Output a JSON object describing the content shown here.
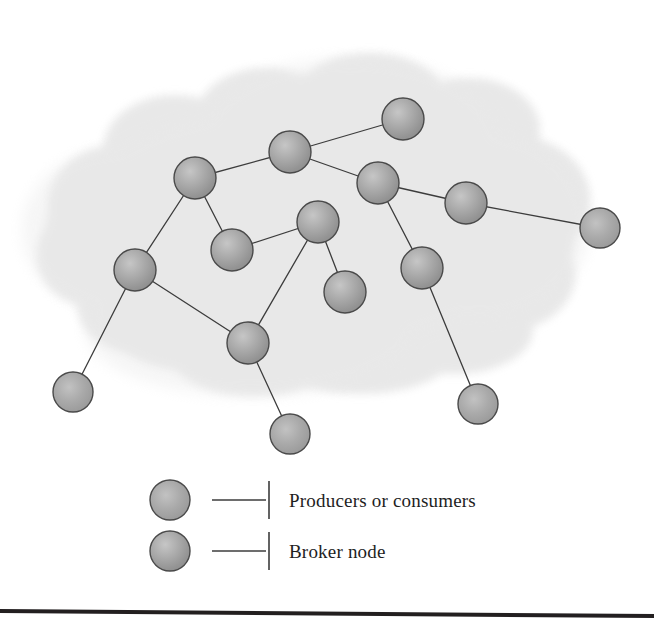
{
  "figure": {
    "background_color": "#ffffff",
    "cloud": {
      "name": "network-cloud",
      "fill_color": "#e6e6e6",
      "edge_color": "#dcdcdc"
    },
    "node_style": {
      "fill_light": "#bdbdbd",
      "fill_mid": "#9c9c9c",
      "fill_dark": "#878787",
      "stroke_color": "#4a4a4a",
      "radius": 21
    },
    "edge_style": {
      "stroke_color": "#3c3c3c",
      "stroke_width": 1.3
    },
    "rule": {
      "name": "bottom-rule",
      "color": "#231f20",
      "thickness": 4
    }
  },
  "graph": {
    "nodes": [
      {
        "id": "b1",
        "label": "broker-node-1",
        "kind": "broker",
        "x": 195,
        "y": 178,
        "r": 21
      },
      {
        "id": "b2",
        "label": "broker-node-2",
        "kind": "broker",
        "x": 290,
        "y": 152,
        "r": 21
      },
      {
        "id": "b3",
        "label": "broker-node-3",
        "kind": "broker",
        "x": 403,
        "y": 119,
        "r": 21
      },
      {
        "id": "b4",
        "label": "broker-node-4",
        "kind": "broker",
        "x": 378,
        "y": 183,
        "r": 21
      },
      {
        "id": "b5",
        "label": "broker-node-5",
        "kind": "broker",
        "x": 466,
        "y": 203,
        "r": 21
      },
      {
        "id": "b6",
        "label": "broker-node-6",
        "kind": "broker",
        "x": 232,
        "y": 250,
        "r": 21
      },
      {
        "id": "b7",
        "label": "broker-node-7",
        "kind": "broker",
        "x": 318,
        "y": 222,
        "r": 21
      },
      {
        "id": "b8",
        "label": "broker-node-8",
        "kind": "broker",
        "x": 135,
        "y": 270,
        "r": 21
      },
      {
        "id": "b9",
        "label": "broker-node-9",
        "kind": "broker",
        "x": 345,
        "y": 292,
        "r": 21
      },
      {
        "id": "b10",
        "label": "broker-node-10",
        "kind": "broker",
        "x": 422,
        "y": 268,
        "r": 21
      },
      {
        "id": "b11",
        "label": "broker-node-11",
        "kind": "broker",
        "x": 248,
        "y": 343,
        "r": 21
      },
      {
        "id": "e1",
        "label": "endpoint-node-right",
        "kind": "endpoint",
        "x": 600,
        "y": 228,
        "r": 20
      },
      {
        "id": "e2",
        "label": "endpoint-node-bottom-left",
        "kind": "endpoint",
        "x": 73,
        "y": 392,
        "r": 20
      },
      {
        "id": "e3",
        "label": "endpoint-node-bottom-mid",
        "kind": "endpoint",
        "x": 290,
        "y": 434,
        "r": 20
      },
      {
        "id": "e4",
        "label": "endpoint-node-bottom-right",
        "kind": "endpoint",
        "x": 478,
        "y": 404,
        "r": 20
      }
    ],
    "edges": [
      {
        "from": "b1",
        "to": "b2"
      },
      {
        "from": "b2",
        "to": "b3"
      },
      {
        "from": "b2",
        "to": "b4"
      },
      {
        "from": "b4",
        "to": "b5"
      },
      {
        "from": "b5",
        "to": "e1"
      },
      {
        "from": "b1",
        "to": "b6"
      },
      {
        "from": "b1",
        "to": "b8"
      },
      {
        "from": "b6",
        "to": "b7"
      },
      {
        "from": "b7",
        "to": "b9"
      },
      {
        "from": "b7",
        "to": "b11"
      },
      {
        "from": "b4",
        "to": "b10"
      },
      {
        "from": "b10",
        "to": "e4"
      },
      {
        "from": "b8",
        "to": "b11"
      },
      {
        "from": "b8",
        "to": "e2"
      },
      {
        "from": "b11",
        "to": "e3"
      }
    ]
  },
  "legend": {
    "name": "diagram-legend",
    "items": [
      {
        "marker": "endpoint",
        "label": "Producers or consumers",
        "swatch_x": 170,
        "swatch_y": 500,
        "text_x": 289,
        "text_y": 507
      },
      {
        "marker": "broker",
        "label": "Broker node",
        "swatch_x": 170,
        "swatch_y": 551,
        "text_x": 289,
        "text_y": 558
      }
    ],
    "leader": {
      "line_x1": 212,
      "line_x2": 266,
      "tick_x": 269,
      "tick_half_height": 19
    }
  }
}
